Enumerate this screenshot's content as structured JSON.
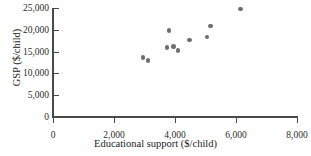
{
  "chart_data": {
    "type": "scatter",
    "title": "",
    "xlabel": "Educational support ($/child)",
    "ylabel": "GSP ($/child)",
    "xlim": [
      0,
      8000
    ],
    "ylim": [
      0,
      25000
    ],
    "xticks": [
      0,
      2000,
      4000,
      6000,
      8000
    ],
    "yticks": [
      0,
      5000,
      10000,
      15000,
      20000,
      25000
    ],
    "xtick_labels": [
      "0",
      "2,000",
      "4,000",
      "6,000",
      "8,000"
    ],
    "ytick_labels": [
      "0",
      "5,000",
      "10,000",
      "15,000",
      "20,000",
      "25,000"
    ],
    "grid": false,
    "legend": null,
    "marker_color": "#6e6e6e",
    "axis_color": "#4a4a4a",
    "points": [
      {
        "x": 2950,
        "y": 13600
      },
      {
        "x": 3120,
        "y": 12900
      },
      {
        "x": 3800,
        "y": 19900
      },
      {
        "x": 3740,
        "y": 15900
      },
      {
        "x": 3950,
        "y": 16200
      },
      {
        "x": 4100,
        "y": 15250
      },
      {
        "x": 4470,
        "y": 17650
      },
      {
        "x": 5050,
        "y": 18350
      },
      {
        "x": 5170,
        "y": 20900
      },
      {
        "x": 6150,
        "y": 24800
      }
    ]
  }
}
